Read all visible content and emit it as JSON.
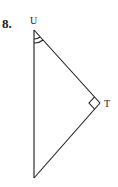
{
  "problem": {
    "number": "8."
  },
  "figure": {
    "type": "right-triangle",
    "vertices": [
      {
        "label": "U",
        "x": 34,
        "y": 30,
        "mark": "double-angle-arc"
      },
      {
        "label": "T",
        "x": 100,
        "y": 103,
        "mark": "right-angle"
      },
      {
        "label": "",
        "x": 34,
        "y": 178,
        "mark": "none"
      }
    ],
    "labels": {
      "top": "U",
      "right": "T",
      "bottom": "-"
    },
    "stroke_color": "#1a1a1a"
  }
}
